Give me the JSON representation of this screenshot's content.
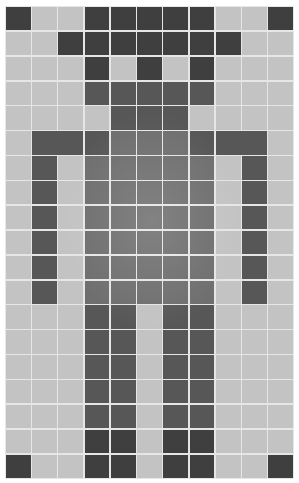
{
  "grid": {
    "columns": 11,
    "rows": 19,
    "legend": {
      "L": "light cell",
      "D": "dark cell",
      "K": "darkest cell (corners/head)",
      "B": "body cell (mid-gray)"
    },
    "colors": {
      "L": "#c3c3c3",
      "D": "#575757",
      "K": "#3f3f3f",
      "B": "#6e6e6e",
      "grid_line": "#e6e6e6",
      "background": "#ffffff"
    },
    "cells": [
      "KLLKKKKKLLK",
      "LLKKKKKKKLL",
      "LLLKLKLKLLL",
      "LLLDDDDDLLL",
      "LLLLDDDLLLL",
      "LDDDBBBDDDL",
      "LDLBBBBBLDL",
      "LDLBBBBBLDL",
      "LDLBBBBBLDL",
      "LDLBBBBBLDL",
      "LDLBBBBBLDL",
      "LDLBBBBBLDL",
      "LLLDDLDDLLL",
      "LLLDDLDDLLL",
      "LLLDDLDDLLL",
      "LLLDDLDDLLL",
      "LLLDDLDDLLL",
      "LLLKKLKKLLL",
      "KLLKKLKKLLK"
    ],
    "merged_spans": [
      {
        "row": 5,
        "col_start": 1,
        "col_end": 2
      },
      {
        "row": 5,
        "col_start": 8,
        "col_end": 9
      }
    ]
  }
}
